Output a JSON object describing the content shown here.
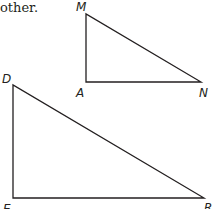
{
  "text": {
    "caption": "other."
  },
  "figure": {
    "stroke_color": "#231f20",
    "triangles": [
      {
        "name": "MAN",
        "right_angle_at": "A",
        "vertices": [
          "M",
          "A",
          "N"
        ]
      },
      {
        "name": "DER",
        "right_angle_at": "E",
        "vertices": [
          "D",
          "E",
          "R"
        ]
      }
    ],
    "labels": {
      "M": "M",
      "A": "A",
      "N": "N",
      "D": "D",
      "E": "E",
      "R": "R"
    }
  }
}
